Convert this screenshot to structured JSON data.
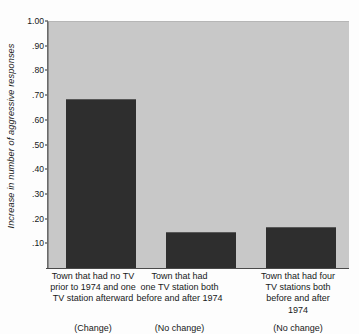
{
  "chart_data": {
    "type": "bar",
    "title": "",
    "xlabel": "",
    "ylabel": "Increase in number of aggressive responses",
    "ylim": [
      0.0,
      1.0
    ],
    "grid": false,
    "legend": "none",
    "ytick_labels": [
      "1.00",
      ".90",
      ".80",
      ".70",
      ".60",
      ".50",
      ".40",
      ".30",
      ".20",
      ".10"
    ],
    "ytick_values": [
      1.0,
      0.9,
      0.8,
      0.7,
      0.6,
      0.5,
      0.4,
      0.3,
      0.2,
      0.1
    ],
    "categories": [
      "Town that had no TV prior to 1974 and one TV station afterward",
      "Town that had one TV station both before and after 1974",
      "Town that had four TV stations both before and after 1974"
    ],
    "category_lines": [
      [
        "Town that had no TV",
        "prior to 1974 and one",
        "TV station afterward"
      ],
      [
        "Town that had",
        "one TV station both",
        "before and after 1974"
      ],
      [
        "Town that had four",
        "TV stations both",
        "before and after",
        "1974"
      ]
    ],
    "category_notes": [
      "(Change)",
      "(No change)",
      "(No change)"
    ],
    "values": [
      0.69,
      0.15,
      0.17
    ],
    "bar_color": "#2e2e2e",
    "plot_background": "#c8c8c8",
    "page_background": "#fdfdfd"
  },
  "axis": {
    "ylabel_text": "Increase in number of aggressive responses"
  }
}
